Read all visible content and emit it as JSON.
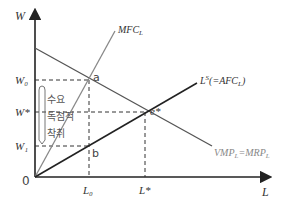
{
  "diagram": {
    "type": "monopsony labor market",
    "axes": {
      "y_label": "W",
      "x_label": "L",
      "origin": "0"
    },
    "y_ticks": [
      "W₀",
      "W*",
      "W₁"
    ],
    "x_ticks": [
      "L₀",
      "L*"
    ],
    "curves": {
      "mfc": "MFC",
      "mfc_sub": "L",
      "supply": "L",
      "supply_sup": "S",
      "supply_rest": "(=AFC",
      "supply_sub": "L",
      "supply_close": ")",
      "demand": "VMP",
      "demand_sub": "L",
      "demand_eq": "=MRP",
      "demand_sub2": "L"
    },
    "points": {
      "a": "a",
      "b": "b",
      "e": "e*"
    },
    "annotation": {
      "line1": "수요",
      "line2": "독점적",
      "line3": "착취"
    },
    "colors": {
      "axis": "#222222",
      "supply_line": "#222222",
      "mfc_line": "#888888",
      "demand_line": "#555555",
      "dashed": "#333333"
    }
  }
}
